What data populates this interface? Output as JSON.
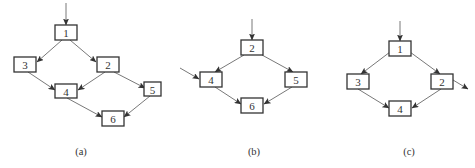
{
  "figure": {
    "panels": [
      {
        "id": "a",
        "caption": "(a)",
        "caption_pos": [
          81,
          151
        ],
        "nodes": [
          {
            "id": "1",
            "label": "1",
            "x": 55,
            "y": 25,
            "w": 22,
            "h": 15
          },
          {
            "id": "3",
            "label": "3",
            "x": 14,
            "y": 57,
            "w": 22,
            "h": 15
          },
          {
            "id": "2",
            "label": "2",
            "x": 97,
            "y": 57,
            "w": 22,
            "h": 15
          },
          {
            "id": "4",
            "label": "4",
            "x": 55,
            "y": 84,
            "w": 22,
            "h": 14
          },
          {
            "id": "5",
            "label": "5",
            "x": 144,
            "y": 82,
            "w": 17,
            "h": 14
          },
          {
            "id": "6",
            "label": "6",
            "x": 102,
            "y": 111,
            "w": 22,
            "h": 15
          }
        ],
        "edges": [
          {
            "from": [
              66,
              3
            ],
            "to": [
              66,
              25
            ],
            "note": "entry"
          },
          {
            "from": [
              62,
              40
            ],
            "to": [
              37,
              62
            ],
            "note": "1->3"
          },
          {
            "from": [
              70,
              40
            ],
            "to": [
              96,
              62
            ],
            "note": "1->2"
          },
          {
            "from": [
              28,
              72
            ],
            "to": [
              55,
              90
            ],
            "note": "3->4"
          },
          {
            "from": [
              105,
              72
            ],
            "to": [
              78,
              90
            ],
            "note": "2->4"
          },
          {
            "from": [
              114,
              72
            ],
            "to": [
              145,
              88
            ],
            "note": "2->5"
          },
          {
            "from": [
              67,
              98
            ],
            "to": [
              102,
              117
            ],
            "note": "4->6"
          },
          {
            "from": [
              150,
              96
            ],
            "to": [
              124,
              117
            ],
            "note": "5->6"
          }
        ]
      },
      {
        "id": "b",
        "caption": "(b)",
        "caption_pos": [
          254,
          151
        ],
        "nodes": [
          {
            "id": "2",
            "label": "2",
            "x": 241,
            "y": 40,
            "w": 22,
            "h": 15
          },
          {
            "id": "4",
            "label": "4",
            "x": 200,
            "y": 72,
            "w": 22,
            "h": 15
          },
          {
            "id": "5",
            "label": "5",
            "x": 285,
            "y": 72,
            "w": 22,
            "h": 15
          },
          {
            "id": "6",
            "label": "6",
            "x": 241,
            "y": 98,
            "w": 22,
            "h": 15
          }
        ],
        "edges": [
          {
            "from": [
              252,
              19
            ],
            "to": [
              252,
              40
            ],
            "note": "entry"
          },
          {
            "from": [
              180,
              68
            ],
            "to": [
              199,
              79
            ],
            "note": "entry to 4"
          },
          {
            "from": [
              244,
              55
            ],
            "to": [
              215,
              72
            ],
            "note": "2->4"
          },
          {
            "from": [
              262,
              55
            ],
            "to": [
              293,
              72
            ],
            "note": "2->5"
          },
          {
            "from": [
              215,
              87
            ],
            "to": [
              241,
              104
            ],
            "note": "4->6"
          },
          {
            "from": [
              292,
              87
            ],
            "to": [
              264,
              104
            ],
            "note": "5->6"
          }
        ]
      },
      {
        "id": "c",
        "caption": "(c)",
        "caption_pos": [
          409,
          151
        ],
        "nodes": [
          {
            "id": "1",
            "label": "1",
            "x": 389,
            "y": 41,
            "w": 22,
            "h": 15
          },
          {
            "id": "3",
            "label": "3",
            "x": 347,
            "y": 74,
            "w": 22,
            "h": 15
          },
          {
            "id": "2",
            "label": "2",
            "x": 431,
            "y": 74,
            "w": 22,
            "h": 15
          },
          {
            "id": "4",
            "label": "4",
            "x": 389,
            "y": 101,
            "w": 22,
            "h": 15
          }
        ],
        "edges": [
          {
            "from": [
              400,
              21
            ],
            "to": [
              400,
              41
            ],
            "note": "entry"
          },
          {
            "from": [
              390,
              52
            ],
            "to": [
              361,
              74
            ],
            "note": "1->3"
          },
          {
            "from": [
              410,
              52
            ],
            "to": [
              440,
              74
            ],
            "note": "1->2"
          },
          {
            "from": [
              358,
              89
            ],
            "to": [
              389,
              108
            ],
            "note": "3->4"
          },
          {
            "from": [
              441,
              89
            ],
            "to": [
              412,
              108
            ],
            "note": "2->4"
          },
          {
            "from": [
              453,
              80
            ],
            "to": [
              468,
              89
            ],
            "note": "exit"
          }
        ]
      }
    ]
  }
}
